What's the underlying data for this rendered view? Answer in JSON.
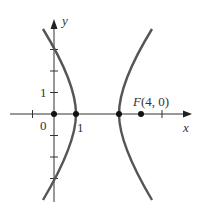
{
  "diagram": {
    "type": "hyperbola-graph",
    "axes": {
      "x_label": "x",
      "y_label": "y",
      "origin_label": "0"
    },
    "tick_labels": {
      "x_one": "1",
      "y_one": "1"
    },
    "focus": {
      "label": "F(4, 0)",
      "x": 4,
      "y": 0
    },
    "vertices": [
      {
        "x": 1,
        "y": 0
      },
      {
        "x": 3,
        "y": 0
      }
    ],
    "center": {
      "x": 2,
      "y": 0
    },
    "equation": "(x-2)^2 - y^2/3 = 1",
    "colors": {
      "curve": "#555555",
      "axis": "#333333",
      "point": "#111111"
    }
  }
}
